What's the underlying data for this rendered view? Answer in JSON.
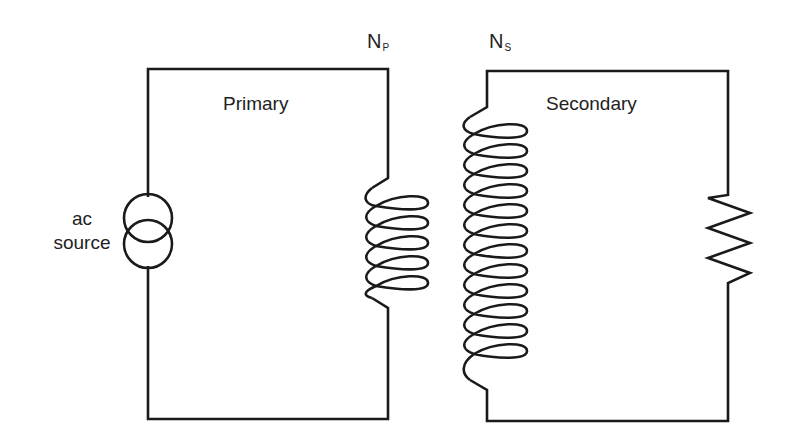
{
  "diagram": {
    "type": "transformer circuit",
    "primary": {
      "label": "Primary",
      "turns_symbol": "N",
      "turns_subscript": "P",
      "coil_loops": 5
    },
    "secondary": {
      "label": "Secondary",
      "turns_symbol": "N",
      "turns_subscript": "S",
      "coil_loops": 12
    },
    "source": {
      "label_line1": "ac",
      "label_line2": "source",
      "icon": "ac-current-source-icon"
    },
    "load": {
      "icon": "resistor-icon"
    },
    "colors": {
      "line": "#1a1a1a",
      "text": "#222222",
      "background": "#ffffff"
    }
  }
}
